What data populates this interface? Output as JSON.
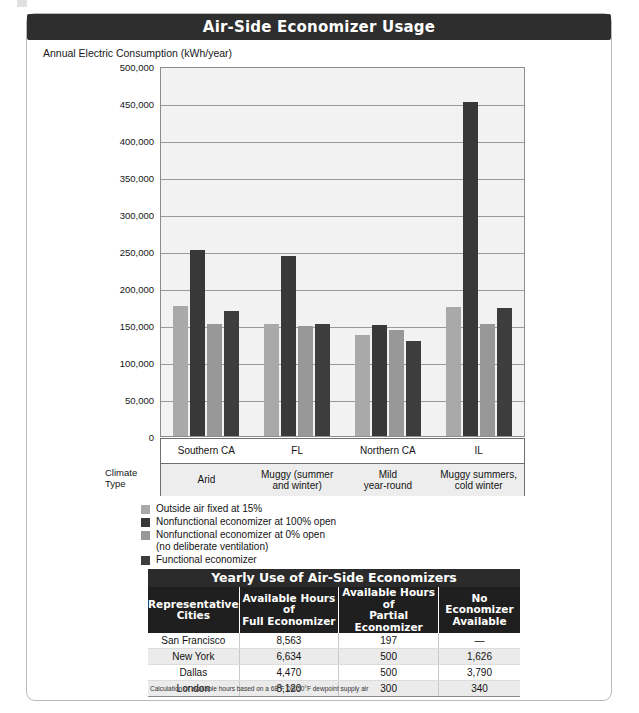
{
  "figure": {
    "title": "Air-Side Economizer Usage",
    "axis_title": "Annual Electric Consumption (kWh/year)",
    "climate_label_line1": "Climate",
    "climate_label_line2": "Type"
  },
  "chart_data": {
    "type": "bar",
    "title": "Air-Side Economizer Usage",
    "xlabel": "",
    "ylabel": "Annual Electric Consumption (kWh/year)",
    "ylim": [
      0,
      500000
    ],
    "ytick_labels": [
      "500,000",
      "450,000",
      "400,000",
      "350,000",
      "300,000",
      "250,000",
      "200,000",
      "150,000",
      "100,000",
      "50,000",
      "0"
    ],
    "ytick_values": [
      500000,
      450000,
      400000,
      350000,
      300000,
      250000,
      200000,
      150000,
      100000,
      50000,
      0
    ],
    "grid": true,
    "legend_position": "below-left",
    "categories": [
      "Southern CA",
      "FL",
      "Northern CA",
      "IL"
    ],
    "climate_types": [
      "Arid",
      "Muggy (summer and winter)",
      "Mild year-round",
      "Muggy summers, cold winter"
    ],
    "series": [
      {
        "name": "Outside air fixed at 15%",
        "color": "#a9a9a9",
        "values": [
          176000,
          152000,
          137000,
          175000
        ]
      },
      {
        "name": "Nonfunctional economizer at 100% open",
        "color": "#383838",
        "values": [
          251000,
          243000,
          150000,
          452000
        ]
      },
      {
        "name": "Nonfunctional economizer at 0% open (no deliberate ventilation)",
        "color": "#989898",
        "values": [
          151000,
          149000,
          143000,
          152000
        ]
      },
      {
        "name": "Functional economizer",
        "color": "#3d3d3d",
        "values": [
          169000,
          152000,
          128000,
          173000
        ]
      }
    ]
  },
  "legend": {
    "items": [
      {
        "label": "Outside air fixed at 15%",
        "color": "#a9a9a9",
        "label2": ""
      },
      {
        "label": "Nonfunctional economizer at 100% open",
        "color": "#383838",
        "label2": ""
      },
      {
        "label": "Nonfunctional economizer at 0% open",
        "color": "#989898",
        "label2": "(no deliberate ventilation)"
      },
      {
        "label": "Functional economizer",
        "color": "#3d3d3d",
        "label2": ""
      }
    ]
  },
  "table": {
    "title": "Yearly Use of Air-Side Economizers",
    "headers": [
      "Representative Cities",
      "Available Hours of Full Economizer",
      "Available Hours of Partial Economizer",
      "No Economizer Available"
    ],
    "rows": [
      [
        "San Francisco",
        "8,563",
        "197",
        "—"
      ],
      [
        "New York",
        "6,634",
        "500",
        "1,626"
      ],
      [
        "Dallas",
        "4,470",
        "500",
        "3,790"
      ],
      [
        "London",
        "8,120",
        "300",
        "340"
      ]
    ],
    "note": "Calculation of available hours based on a 68°F DB/50°F dewpoint supply air"
  }
}
